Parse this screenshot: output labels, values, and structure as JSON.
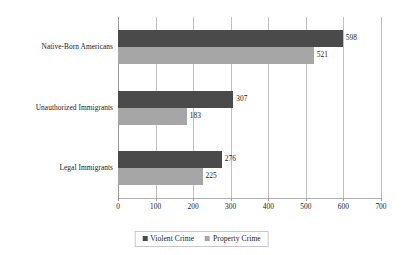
{
  "chart_data": {
    "type": "bar",
    "orientation": "horizontal",
    "title": "",
    "xlabel": "",
    "ylabel": "",
    "xlim": [
      0,
      700
    ],
    "xticks": [
      0,
      100,
      200,
      300,
      400,
      500,
      600,
      700
    ],
    "xtick_labels": [
      "0",
      "100",
      "200",
      "300",
      "400",
      "500",
      "600",
      "700"
    ],
    "grid": true,
    "legend_position": "bottom-center",
    "categories": [
      "Native-Born Americans",
      "Unauthorized Immigrants",
      "Legal Immigrants"
    ],
    "series": [
      {
        "name": "Violent Crime",
        "color": "#4a4a4a",
        "values": [
          598,
          307,
          276
        ],
        "labels": [
          "598",
          "307",
          "276"
        ]
      },
      {
        "name": "Property Crime",
        "color": "#a6a6a6",
        "values": [
          521,
          183,
          225
        ],
        "labels": [
          "521",
          "183",
          "225"
        ]
      }
    ]
  },
  "legend": {
    "items": [
      {
        "label": "Violent Crime",
        "swatch": "violent-crime-swatch"
      },
      {
        "label": "Property Crime",
        "swatch": "property-crime-swatch"
      }
    ]
  }
}
